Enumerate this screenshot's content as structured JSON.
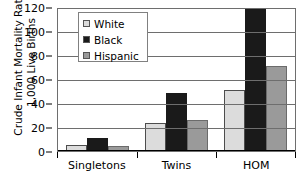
{
  "chart_data": {
    "type": "bar",
    "title": "",
    "xlabel": "",
    "ylabel": "Crude Infant Mortality Rate/\n1,000 Live Births",
    "categories": [
      "Singletons",
      "Twins",
      "HOM"
    ],
    "series": [
      {
        "name": "White",
        "color": "#dcdcdc",
        "values": [
          5,
          23,
          51
        ]
      },
      {
        "name": "Black",
        "color": "#1a1a1a",
        "values": [
          11,
          48,
          120
        ]
      },
      {
        "name": "Hispanic",
        "color": "#9a9a9a",
        "values": [
          4.5,
          26,
          71
        ]
      }
    ],
    "ylim": [
      0,
      120
    ],
    "yticks": [
      0,
      20,
      40,
      60,
      80,
      100,
      120
    ],
    "ytick_labels": [
      "0",
      "20",
      "40",
      "60",
      "80",
      "100",
      "120"
    ],
    "grid": true,
    "legend_position": "top-left-inside"
  },
  "legend": {
    "items": [
      {
        "label": "White"
      },
      {
        "label": "Black"
      },
      {
        "label": "Hispanic"
      }
    ]
  }
}
